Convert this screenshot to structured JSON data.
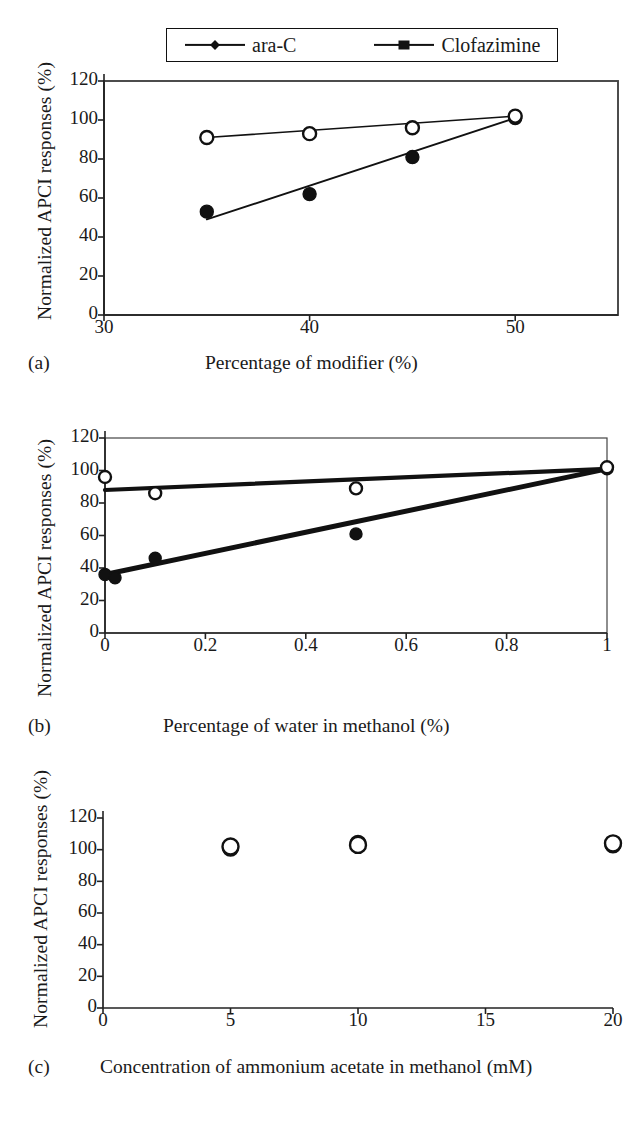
{
  "figure": {
    "shared_ylabel": "Normalized APCI responses (%)",
    "legend": {
      "entries": [
        {
          "label": "ara-C",
          "marker": "diamond-marker-icon",
          "color": "#111111"
        },
        {
          "label": "Clofazimine",
          "marker": "square-marker-icon",
          "color": "#111111"
        }
      ]
    }
  },
  "chart_data": [
    {
      "type": "scatter",
      "panel": "a",
      "panel_label": "(a)",
      "title": "",
      "xlabel": "Percentage of modifier (%)",
      "ylabel": "Normalized APCI responses (%)",
      "xlim": [
        30,
        55
      ],
      "ylim": [
        0,
        120
      ],
      "xticks": [
        30,
        40,
        50
      ],
      "yticks": [
        0,
        20,
        40,
        60,
        80,
        100,
        120
      ],
      "grid": false,
      "legend_position": "top-outside",
      "series": [
        {
          "name": "ara-C",
          "marker": "filled-circle",
          "x": [
            35,
            40,
            45,
            50
          ],
          "y": [
            53,
            62,
            81,
            101
          ],
          "trendline": {
            "x": [
              35,
              50
            ],
            "y": [
              49,
              101
            ]
          }
        },
        {
          "name": "Clofazimine",
          "marker": "open-circle",
          "x": [
            35,
            40,
            45,
            50
          ],
          "y": [
            91,
            93,
            96,
            102
          ],
          "trendline": {
            "x": [
              35,
              50
            ],
            "y": [
              91,
              102
            ]
          }
        }
      ]
    },
    {
      "type": "scatter",
      "panel": "b",
      "panel_label": "(b)",
      "title": "",
      "xlabel": "Percentage of water in methanol (%)",
      "ylabel": "Normalized APCI responses (%)",
      "xlim": [
        0,
        1
      ],
      "ylim": [
        0,
        120
      ],
      "xticks": [
        0,
        0.2,
        0.4,
        0.6,
        0.8,
        1
      ],
      "xticklabels": [
        "0",
        "0.2",
        "0.4",
        "0.6",
        "0.8",
        "1"
      ],
      "yticks": [
        0,
        20,
        40,
        60,
        80,
        100,
        120
      ],
      "grid": false,
      "legend_position": "shared-top",
      "series": [
        {
          "name": "ara-C",
          "marker": "filled-circle",
          "x": [
            0,
            0.02,
            0.1,
            0.5,
            1
          ],
          "y": [
            36,
            34,
            46,
            61,
            101
          ],
          "trendline": {
            "x": [
              0,
              1
            ],
            "y": [
              36,
              101
            ]
          }
        },
        {
          "name": "Clofazimine",
          "marker": "open-circle",
          "x": [
            0,
            0.1,
            0.5,
            1
          ],
          "y": [
            96,
            86,
            89,
            102
          ],
          "trendline": {
            "x": [
              0,
              1
            ],
            "y": [
              88,
              101
            ]
          }
        }
      ]
    },
    {
      "type": "scatter",
      "panel": "c",
      "panel_label": "(c)",
      "title": "",
      "xlabel": "Concentration of ammonium acetate in methanol (mM)",
      "ylabel": "Normalized APCI responses (%)",
      "xlim": [
        0,
        20
      ],
      "ylim": [
        0,
        120
      ],
      "xticks": [
        0,
        5,
        10,
        15,
        20
      ],
      "yticks": [
        0,
        20,
        40,
        60,
        80,
        100,
        120
      ],
      "grid": false,
      "legend_position": "shared-top",
      "series": [
        {
          "name": "ara-C",
          "marker": "filled-circle",
          "x": [
            5,
            10,
            20
          ],
          "y": [
            101,
            104,
            103
          ]
        },
        {
          "name": "Clofazimine",
          "marker": "open-circle",
          "x": [
            5,
            10,
            20
          ],
          "y": [
            102,
            103,
            104
          ]
        }
      ]
    }
  ]
}
